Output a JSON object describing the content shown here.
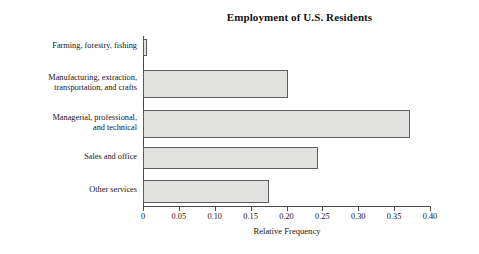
{
  "chart_data": {
    "type": "bar",
    "orientation": "horizontal",
    "title": "Employment of U.S. Residents",
    "xlabel": "Relative Frequency",
    "ylabel": "",
    "xlim": [
      0,
      0.4
    ],
    "grid": false,
    "legend": null,
    "bar_fill_color": "#e2e2e0",
    "bar_edge_color": "#5c5c5c",
    "axis_color": "#4a4a4a",
    "categories": [
      "Farming, forestry, fishing",
      "Manufacturing, extraction,\ntransportation, and crafts",
      "Managerial, professional,\nand technical",
      "Sales and office",
      "Other services"
    ],
    "values": [
      0.006,
      0.202,
      0.372,
      0.244,
      0.176
    ],
    "xticks": [
      0,
      0.05,
      0.1,
      0.15,
      0.2,
      0.25,
      0.3,
      0.35,
      0.4
    ],
    "xticklabels": [
      "0",
      "0.05",
      "0.10",
      "0.15",
      "0.20",
      "0.25",
      "0.30",
      "0.35",
      "0.40"
    ]
  }
}
